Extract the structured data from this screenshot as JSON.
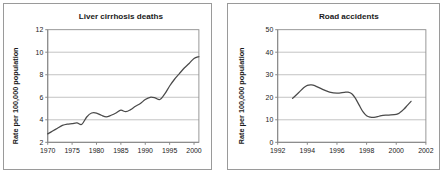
{
  "figure": {
    "panel_border_color": "#9a9a9a",
    "background_color": "#ffffff",
    "line_color": "#4a4a4a",
    "grid_color": "#a8a8a8"
  },
  "chart_data": [
    {
      "id": "liver-cirrhosis-deaths",
      "type": "line",
      "title": "Liver cirrhosis deaths",
      "xlabel": "",
      "ylabel": "Rate per 100,000 population",
      "xlim": [
        1970,
        2001
      ],
      "ylim": [
        2,
        12
      ],
      "xticks": [
        1970,
        1975,
        1980,
        1985,
        1990,
        1995,
        2000
      ],
      "xtick_labels": [
        "1970",
        "1975",
        "1980",
        "1985",
        "1990",
        "1995",
        "2000"
      ],
      "yticks": [
        2,
        4,
        6,
        8,
        10,
        12
      ],
      "ytick_labels": [
        "2",
        "4",
        "6",
        "8",
        "10",
        "12"
      ],
      "grid": "horizontal",
      "legend": "none",
      "series": [
        {
          "name": "Liver cirrhosis death rate",
          "x": [
            1970,
            1971,
            1972,
            1973,
            1974,
            1975,
            1976,
            1977,
            1978,
            1979,
            1980,
            1981,
            1982,
            1983,
            1984,
            1985,
            1986,
            1987,
            1988,
            1989,
            1990,
            1991,
            1992,
            1993,
            1994,
            1995,
            1996,
            1997,
            1998,
            1999,
            2000,
            2001
          ],
          "values": [
            2.75,
            3.0,
            3.25,
            3.5,
            3.62,
            3.66,
            3.72,
            3.6,
            4.25,
            4.6,
            4.6,
            4.4,
            4.25,
            4.4,
            4.6,
            4.85,
            4.72,
            4.9,
            5.2,
            5.45,
            5.8,
            6.0,
            5.95,
            5.8,
            6.3,
            7.0,
            7.6,
            8.1,
            8.6,
            9.0,
            9.45,
            9.6
          ]
        }
      ]
    },
    {
      "id": "road-accidents",
      "type": "line",
      "title": "Road accidents",
      "xlabel": "",
      "ylabel": "Rate per 100,000 population",
      "xlim": [
        1992,
        2002
      ],
      "ylim": [
        0,
        50
      ],
      "xticks": [
        1992,
        1994,
        1996,
        1998,
        2000,
        2002
      ],
      "xtick_labels": [
        "1992",
        "1994",
        "1996",
        "1998",
        "2000",
        "2002"
      ],
      "yticks": [
        0,
        10,
        20,
        30,
        40,
        50
      ],
      "ytick_labels": [
        "0",
        "10",
        "20",
        "30",
        "40",
        "50"
      ],
      "grid": "horizontal",
      "legend": "none",
      "series": [
        {
          "name": "Road accident rate",
          "x": [
            1993.0,
            1993.25,
            1993.5,
            1993.75,
            1994.0,
            1994.25,
            1994.5,
            1995.0,
            1995.5,
            1996.0,
            1996.5,
            1996.75,
            1997.0,
            1997.25,
            1997.5,
            1997.75,
            1998.0,
            1998.25,
            1998.5,
            1998.75,
            1999.0,
            1999.5,
            2000.0,
            2000.25,
            2000.5,
            2000.75,
            2001.0
          ],
          "values": [
            19.5,
            21.0,
            22.6,
            24.2,
            25.3,
            25.5,
            25.2,
            23.6,
            22.3,
            21.8,
            22.2,
            22.3,
            21.6,
            19.5,
            16.5,
            13.6,
            11.8,
            11.2,
            11.1,
            11.4,
            11.9,
            12.1,
            12.4,
            13.2,
            14.6,
            16.4,
            18.2
          ]
        }
      ]
    }
  ]
}
